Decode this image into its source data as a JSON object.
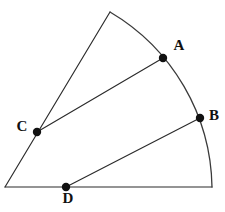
{
  "figure": {
    "background_color": "#ffffff",
    "line_color": "#2b2b2b",
    "arc_color": "#3a3a3a",
    "dot_color": "#111111",
    "label_color": "#111111",
    "width": 225,
    "height": 212
  },
  "geometry": {
    "apex": {
      "name": "sector-apex",
      "x": 5,
      "y": 187
    },
    "base_right": {
      "name": "base-right-corner",
      "x": 212,
      "y": 187
    },
    "top_vertex": {
      "name": "upper-radius-endpoint",
      "x": 110,
      "y": 12
    },
    "radius": 207,
    "arc_sweep_description": "arc from upper radius endpoint through A and B down to base right corner"
  },
  "points": [
    {
      "id": "A",
      "label": "A",
      "x": 163,
      "y": 58,
      "label_x": 179,
      "label_y": 47,
      "dot_radius": 4.2,
      "on": "arc"
    },
    {
      "id": "B",
      "label": "B",
      "x": 200,
      "y": 118,
      "label_x": 214,
      "label_y": 117,
      "dot_radius": 4.2,
      "on": "arc"
    },
    {
      "id": "C",
      "label": "C",
      "x": 37,
      "y": 132,
      "label_x": 22,
      "label_y": 128,
      "dot_radius": 4.2,
      "on": "upper-radius"
    },
    {
      "id": "D",
      "label": "D",
      "x": 66,
      "y": 187,
      "label_x": 68,
      "label_y": 200,
      "dot_radius": 4.2,
      "on": "baseline"
    }
  ],
  "segments": [
    {
      "id": "baseline",
      "name": "baseline-segment",
      "from": "apex",
      "to": "base_right"
    },
    {
      "id": "upper-radius",
      "name": "upper-radius-segment",
      "from": "apex",
      "to": "top_vertex"
    },
    {
      "id": "chord-CA",
      "name": "chord-c-to-a",
      "from": "C",
      "to": "A"
    },
    {
      "id": "chord-DB",
      "name": "chord-d-to-b",
      "from": "D",
      "to": "B"
    }
  ],
  "paths": {
    "baseline_d": "M 5 187 L 212 187",
    "upper_radius_d": "M 5 187 L 110 12",
    "arc_d": "M 110 12 A 207 207 0 0 1 212 187",
    "chord_ca_d": "M 37 132 L 163 58",
    "chord_db_d": "M 66 187 L 200 118"
  }
}
